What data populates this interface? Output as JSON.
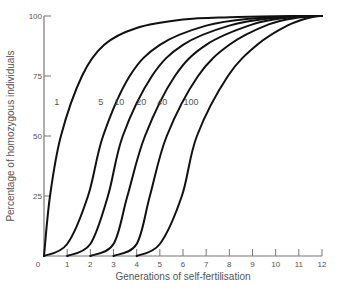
{
  "chart_data": {
    "type": "line",
    "title": "",
    "xlabel": "Generations of self-fertilisation",
    "ylabel": "Percentage of homozygous individuals",
    "xlim": [
      0,
      12
    ],
    "ylim": [
      0,
      100
    ],
    "x_ticks": [
      0,
      1,
      2,
      3,
      4,
      5,
      6,
      7,
      8,
      9,
      10,
      11,
      12
    ],
    "y_ticks": [
      0,
      25,
      50,
      75,
      100
    ],
    "grid": false,
    "legend": "inline labels on curves",
    "series": [
      {
        "name": "1",
        "label_pos": [
          0.55,
          63
        ],
        "points": [
          [
            0,
            0
          ],
          [
            0.26,
            25
          ],
          [
            0.73,
            50
          ],
          [
            1.64,
            75
          ],
          [
            2.6,
            88
          ],
          [
            4,
            95
          ],
          [
            6,
            98.5
          ],
          [
            8,
            99.5
          ],
          [
            10,
            99.9
          ],
          [
            12,
            100
          ]
        ]
      },
      {
        "name": "5",
        "label_pos": [
          2.45,
          63
        ],
        "points": [
          [
            0,
            0
          ],
          [
            1,
            5
          ],
          [
            1.9,
            25
          ],
          [
            2.55,
            50
          ],
          [
            3.7,
            75
          ],
          [
            5,
            88
          ],
          [
            7,
            96
          ],
          [
            9,
            99
          ],
          [
            11,
            99.8
          ],
          [
            12,
            100
          ]
        ]
      },
      {
        "name": "10",
        "label_pos": [
          3.25,
          63
        ],
        "points": [
          [
            1,
            0
          ],
          [
            2,
            5
          ],
          [
            2.76,
            25
          ],
          [
            3.4,
            50
          ],
          [
            4.66,
            75
          ],
          [
            6,
            88
          ],
          [
            8,
            96
          ],
          [
            10,
            99.3
          ],
          [
            11.5,
            100
          ],
          [
            12,
            100
          ]
        ]
      },
      {
        "name": "20",
        "label_pos": [
          4.2,
          63
        ],
        "points": [
          [
            2,
            0
          ],
          [
            3,
            5
          ],
          [
            3.6,
            25
          ],
          [
            4.36,
            50
          ],
          [
            5.65,
            75
          ],
          [
            7,
            88
          ],
          [
            9,
            96.5
          ],
          [
            10.5,
            99.3
          ],
          [
            11.7,
            100
          ],
          [
            12,
            100
          ]
        ]
      },
      {
        "name": "40",
        "label_pos": [
          5.1,
          63
        ],
        "points": [
          [
            3,
            0
          ],
          [
            4,
            5
          ],
          [
            4.57,
            25
          ],
          [
            5.3,
            50
          ],
          [
            6.65,
            75
          ],
          [
            8,
            88
          ],
          [
            9.7,
            96.5
          ],
          [
            11,
            99.4
          ],
          [
            11.8,
            100
          ],
          [
            12,
            100
          ]
        ]
      },
      {
        "name": "100",
        "label_pos": [
          6.35,
          63
        ],
        "points": [
          [
            4,
            0
          ],
          [
            5,
            5
          ],
          [
            5.95,
            25
          ],
          [
            6.6,
            50
          ],
          [
            7.94,
            75
          ],
          [
            9.2,
            88
          ],
          [
            10.5,
            96
          ],
          [
            11.5,
            99.4
          ],
          [
            12,
            100
          ]
        ]
      }
    ]
  }
}
